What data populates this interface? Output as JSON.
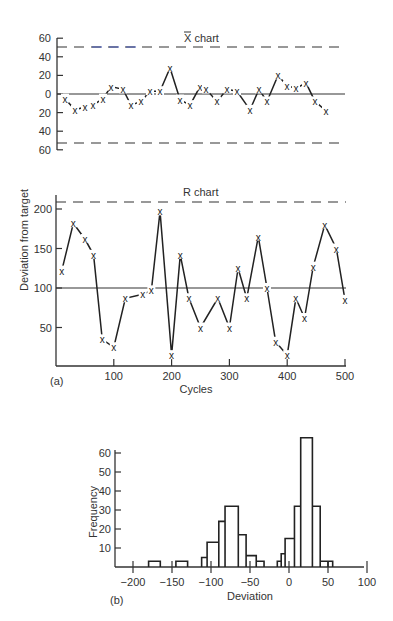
{
  "chart_data": [
    {
      "type": "line",
      "title": "X̄ chart",
      "ylabel": "Deviation from target",
      "yticks": [
        60,
        40,
        20,
        0,
        20,
        40,
        60
      ],
      "ylim": [
        -60,
        60
      ],
      "center_line": 0,
      "ucl": 50,
      "lcl": -50,
      "x": [
        10,
        20,
        30,
        40,
        50,
        60,
        70,
        80,
        90,
        100,
        110,
        120,
        130,
        140,
        150,
        160,
        170,
        180,
        190,
        200,
        210,
        220,
        230,
        240,
        250,
        260,
        270,
        280,
        290,
        300,
        310,
        320,
        330,
        340,
        350,
        360,
        370,
        380,
        390,
        400,
        410,
        420,
        430,
        440,
        450,
        460,
        470,
        480,
        490,
        500
      ],
      "values": [
        -5,
        -17,
        -14,
        -13,
        -8,
        5,
        9,
        6,
        -12,
        -8,
        5,
        5,
        28,
        -6,
        -12,
        8,
        5,
        -8,
        5,
        6,
        -13,
        6,
        -7,
        20,
        9,
        6,
        12,
        -8,
        -17,
        -2,
        -10,
        -14,
        -17,
        -10,
        -5,
        5,
        3,
        -18,
        -5,
        5,
        10,
        6,
        5,
        0,
        -3,
        5,
        8,
        0,
        -10,
        -17
      ],
      "points_plotted": [
        [
          65,
          -5
        ],
        [
          75,
          -17
        ],
        [
          85,
          -14
        ],
        [
          93,
          -12
        ],
        [
          103,
          -5
        ],
        [
          111,
          8
        ],
        [
          123,
          5
        ],
        [
          131,
          -12
        ],
        [
          141,
          -8
        ],
        [
          150,
          3
        ],
        [
          160,
          3
        ],
        [
          170,
          28
        ],
        [
          180,
          -6
        ],
        [
          190,
          -12
        ],
        [
          200,
          8
        ],
        [
          206,
          5
        ],
        [
          217,
          -8
        ],
        [
          227,
          5
        ],
        [
          237,
          3
        ],
        [
          250,
          -17
        ],
        [
          259,
          5
        ],
        [
          267,
          -8
        ],
        [
          278,
          20
        ],
        [
          287,
          9
        ],
        [
          296,
          6
        ],
        [
          306,
          12
        ],
        [
          315,
          -8
        ],
        [
          326,
          -18
        ]
      ]
    },
    {
      "type": "line",
      "title": "R chart",
      "xlabel": "Cycles",
      "ylabel": "Deviation from target",
      "xticks": [
        100,
        200,
        300,
        400,
        500
      ],
      "yticks": [
        50,
        100,
        150,
        200
      ],
      "xlim": [
        0,
        500
      ],
      "ylim": [
        0,
        215
      ],
      "center_line": 100,
      "ucl": 210,
      "x": [
        10,
        30,
        50,
        65,
        80,
        100,
        120,
        150,
        165,
        180,
        200,
        215,
        230,
        250,
        280,
        300,
        315,
        330,
        350,
        365,
        380,
        400,
        415,
        430,
        445,
        465,
        485,
        500
      ],
      "values": [
        122,
        182,
        162,
        142,
        35,
        25,
        87,
        92,
        97,
        197,
        15,
        142,
        87,
        50,
        87,
        50,
        125,
        87,
        165,
        100,
        32,
        15,
        87,
        62,
        127,
        180,
        150,
        85
      ]
    },
    {
      "type": "bar",
      "subtype": "histogram",
      "xlabel": "Deviation",
      "ylabel": "Frequency",
      "xticks": [
        -200,
        -150,
        -100,
        -50,
        0,
        50,
        100
      ],
      "yticks": [
        10,
        20,
        30,
        40,
        50,
        60
      ],
      "xlim": [
        -220,
        100
      ],
      "ylim": [
        0,
        70
      ],
      "bins": [
        {
          "x0": -180,
          "x1": -165,
          "count": 3
        },
        {
          "x0": -165,
          "x1": -150,
          "count": 0
        },
        {
          "x0": -145,
          "x1": -130,
          "count": 3
        },
        {
          "x0": -112,
          "x1": -105,
          "count": 5
        },
        {
          "x0": -105,
          "x1": -90,
          "count": 13
        },
        {
          "x0": -90,
          "x1": -82,
          "count": 24
        },
        {
          "x0": -82,
          "x1": -65,
          "count": 32
        },
        {
          "x0": -65,
          "x1": -55,
          "count": 17
        },
        {
          "x0": -55,
          "x1": -42,
          "count": 6
        },
        {
          "x0": -42,
          "x1": -32,
          "count": 3
        },
        {
          "x0": -15,
          "x1": -10,
          "count": 3
        },
        {
          "x0": -10,
          "x1": -5,
          "count": 7
        },
        {
          "x0": -5,
          "x1": 7,
          "count": 15
        },
        {
          "x0": 7,
          "x1": 15,
          "count": 32
        },
        {
          "x0": 15,
          "x1": 30,
          "count": 68
        },
        {
          "x0": 30,
          "x1": 40,
          "count": 32
        },
        {
          "x0": 40,
          "x1": 50,
          "count": 3
        },
        {
          "x0": 50,
          "x1": 56,
          "count": 3
        }
      ]
    }
  ],
  "labels": {
    "xbar_title": "X chart",
    "r_title": "R chart",
    "ylabel": "Deviation from target",
    "xlabel_a": "Cycles",
    "panel_a": "(a)",
    "hist_ylabel": "Frequency",
    "hist_xlabel": "Deviation",
    "panel_b": "(b)"
  },
  "colors": {
    "ink": "#222222",
    "axis": "#333333",
    "ucl_accent": "#3a4fb0"
  }
}
